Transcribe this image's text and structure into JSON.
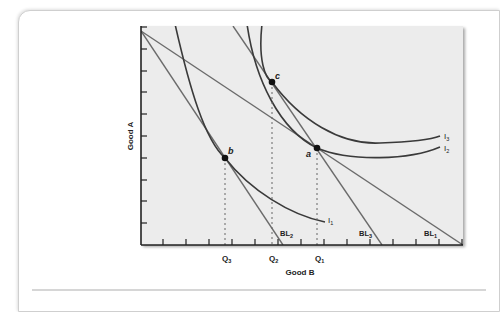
{
  "figure": {
    "y_axis_label": "Good A",
    "x_axis_label": "Good B",
    "x_tick_labels": [
      {
        "main": "Q",
        "sub": "3"
      },
      {
        "main": "Q",
        "sub": "2"
      },
      {
        "main": "Q",
        "sub": "1"
      }
    ],
    "budget_lines": [
      {
        "main": "BL",
        "sub": "1"
      },
      {
        "main": "BL",
        "sub": "2"
      },
      {
        "main": "BL",
        "sub": "3"
      }
    ],
    "indifference_curves": [
      {
        "main": "I",
        "sub": "1"
      },
      {
        "main": "I",
        "sub": "2"
      },
      {
        "main": "I",
        "sub": "3"
      }
    ],
    "points": [
      "a",
      "b",
      "c"
    ],
    "colors": {
      "plot_background": "#ececec",
      "curve": "#3a3a3a",
      "budget_line": "#6b6b6b",
      "axis": "#222222"
    }
  }
}
